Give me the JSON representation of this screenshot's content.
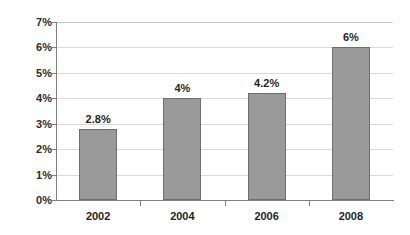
{
  "chart_data": {
    "type": "bar",
    "title": "",
    "subtitle": "",
    "xlabel": "",
    "ylabel": "",
    "categories": [
      "2002",
      "2004",
      "2006",
      "2008"
    ],
    "values": [
      2.8,
      4,
      4.2,
      6
    ],
    "data_labels": [
      "2.8%",
      "4%",
      "4.2%",
      "6%"
    ],
    "ylim": [
      0,
      7
    ],
    "ytick_values": [
      0,
      1,
      2,
      3,
      4,
      5,
      6,
      7
    ],
    "ytick_labels": [
      "0%",
      "1%",
      "2%",
      "3%",
      "4%",
      "5%",
      "6%",
      "7%"
    ],
    "grid": true,
    "grid_axis": "y",
    "legend": false,
    "legend_position": "none",
    "series": [
      {
        "name": "",
        "values": [
          2.8,
          4,
          4.2,
          6
        ]
      }
    ],
    "colors": {
      "bar_fill": "#9a9a9a",
      "bar_border": "#6e6e6e",
      "gridline": "#d9d9d9",
      "axis": "#808080",
      "text": "#1f1f1f",
      "background": "#ffffff"
    }
  }
}
